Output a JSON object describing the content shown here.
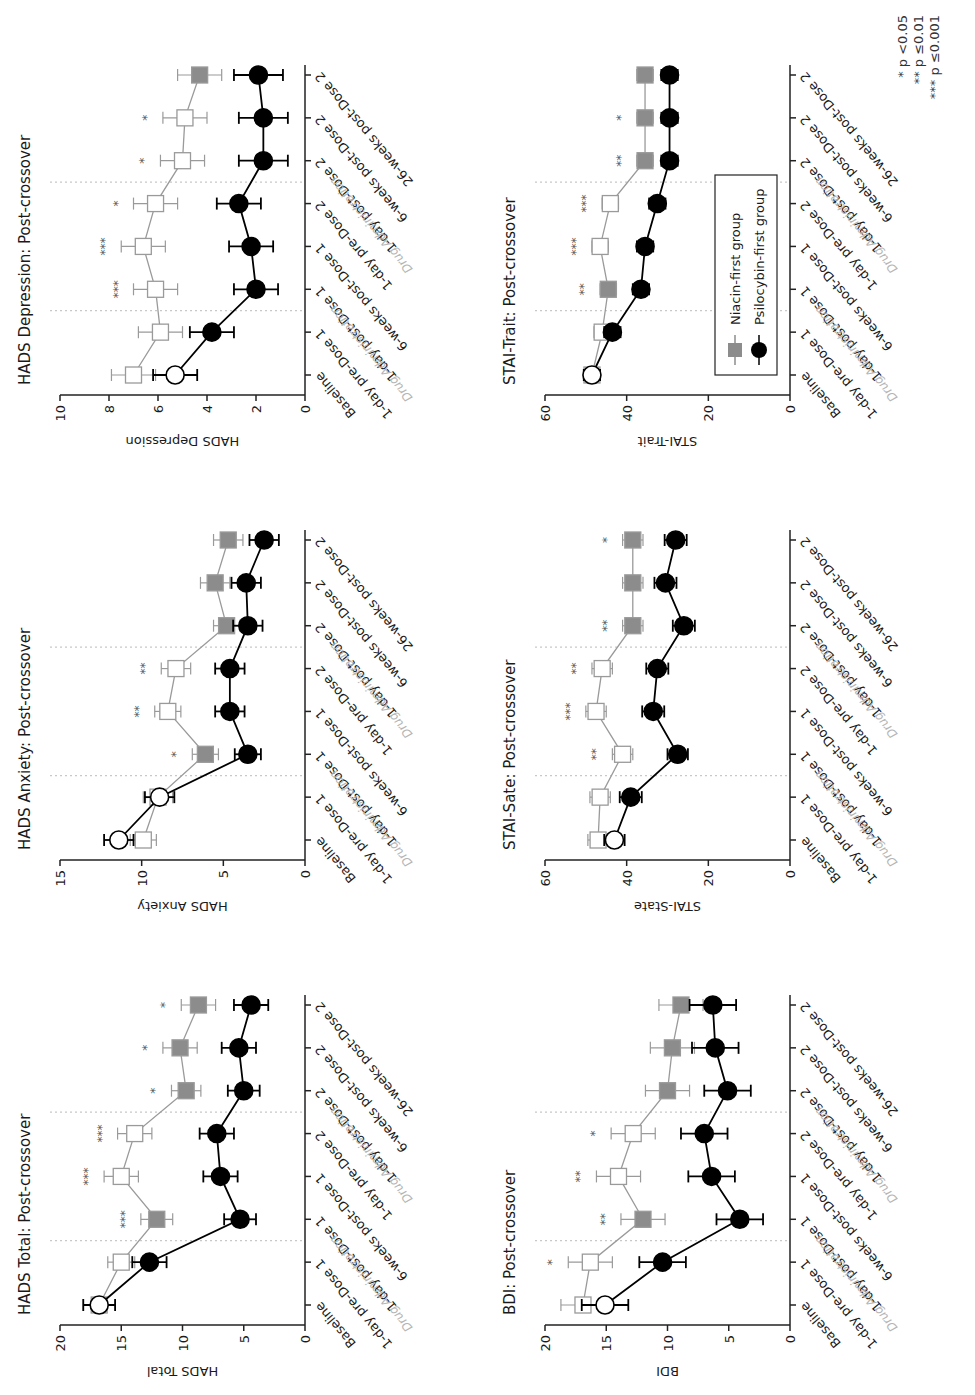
{
  "chart_data": [
    {
      "id": "hads_total",
      "type": "line",
      "title": "HADS Total: Post-crossover",
      "xlabel": "",
      "ylabel": "HADS Total",
      "ylim": [
        0,
        20
      ],
      "yticks": [
        0,
        5,
        10,
        15,
        20
      ],
      "categories": [
        "Baseline",
        "1-day pre-Dose 1",
        "1-day post-Dose 1",
        "6-weeks post-Dose 1",
        "1-day pre-Dose 2",
        "1-day post-Dose 2",
        "6-weeks post-Dose 2",
        "26-weeks post-Dose 2"
      ],
      "series": [
        {
          "name": "Niacin-first group",
          "values": [
            16.8,
            15.0,
            12.1,
            15.0,
            13.9,
            9.7,
            10.2,
            8.7
          ],
          "errors": [
            1.3,
            1.1,
            1.3,
            1.4,
            1.4,
            1.2,
            1.4,
            1.4
          ],
          "filled": [
            false,
            false,
            true,
            false,
            false,
            true,
            true,
            true
          ]
        },
        {
          "name": "Psilocybin-first group",
          "values": [
            16.8,
            12.7,
            5.3,
            6.9,
            7.2,
            5.0,
            5.4,
            4.4
          ],
          "errors": [
            1.3,
            1.4,
            1.3,
            1.4,
            1.4,
            1.3,
            1.4,
            1.4
          ],
          "filled": [
            false,
            true,
            true,
            true,
            true,
            true,
            true,
            true
          ]
        }
      ],
      "significance": [
        "",
        "",
        "***",
        "***",
        "***",
        "*",
        "*",
        "*"
      ]
    },
    {
      "id": "hads_anxiety",
      "type": "line",
      "title": "HADS Anxiety: Post-crossover",
      "xlabel": "",
      "ylabel": "HADS Anxiety",
      "ylim": [
        0,
        15
      ],
      "yticks": [
        0,
        5,
        10,
        15
      ],
      "categories": [
        "Baseline",
        "1-day pre-Dose 1",
        "1-day post-Dose 1",
        "6-weeks post-Dose 1",
        "1-day pre-Dose 2",
        "1-day post-Dose 2",
        "6-weeks post-Dose 2",
        "26-weeks post-Dose 2"
      ],
      "series": [
        {
          "name": "Niacin-first group",
          "values": [
            9.9,
            9.0,
            6.1,
            8.4,
            7.9,
            4.8,
            5.5,
            4.7
          ],
          "errors": [
            0.8,
            0.9,
            0.8,
            0.8,
            0.9,
            0.8,
            0.9,
            0.9
          ],
          "filled": [
            false,
            false,
            true,
            false,
            false,
            true,
            true,
            true
          ]
        },
        {
          "name": "Psilocybin-first group",
          "values": [
            11.4,
            8.9,
            3.5,
            4.6,
            4.6,
            3.5,
            3.6,
            2.5
          ],
          "errors": [
            0.9,
            0.9,
            0.8,
            0.9,
            0.9,
            0.9,
            0.9,
            0.9
          ],
          "filled": [
            false,
            false,
            true,
            true,
            true,
            true,
            true,
            true
          ]
        }
      ],
      "significance": [
        "",
        "",
        "*",
        "**",
        "**",
        "",
        "",
        ""
      ]
    },
    {
      "id": "hads_depression",
      "type": "line",
      "title": "HADS Depression: Post-crossover",
      "xlabel": "",
      "ylabel": "HADS Depression",
      "ylim": [
        0,
        10
      ],
      "yticks": [
        0,
        2,
        4,
        6,
        8,
        10
      ],
      "categories": [
        "Baseline",
        "1-day pre-Dose 1",
        "1-day post-Dose 1",
        "6-weeks post-Dose 1",
        "1-day pre-Dose 2",
        "1-day post-Dose 2",
        "6-weeks post-Dose 2",
        "26-weeks post-Dose 2"
      ],
      "series": [
        {
          "name": "Niacin-first group",
          "values": [
            7.0,
            5.9,
            6.1,
            6.6,
            6.1,
            5.0,
            4.9,
            4.3
          ],
          "errors": [
            0.9,
            0.9,
            0.9,
            0.9,
            0.9,
            0.9,
            0.9,
            0.9
          ],
          "filled": [
            false,
            false,
            false,
            false,
            false,
            false,
            false,
            true
          ]
        },
        {
          "name": "Psilocybin-first group",
          "values": [
            5.3,
            3.8,
            2.0,
            2.2,
            2.7,
            1.7,
            1.7,
            1.9
          ],
          "errors": [
            0.9,
            0.9,
            0.9,
            0.9,
            0.9,
            1.0,
            1.0,
            1.0
          ],
          "filled": [
            false,
            true,
            true,
            true,
            true,
            true,
            true,
            true
          ]
        }
      ],
      "significance": [
        "",
        "",
        "***",
        "***",
        "*",
        "*",
        "*",
        ""
      ]
    },
    {
      "id": "bdi",
      "type": "line",
      "title": "BDI: Post-crossover",
      "xlabel": "",
      "ylabel": "BDI",
      "ylim": [
        0,
        20
      ],
      "yticks": [
        0,
        5,
        10,
        15,
        20
      ],
      "categories": [
        "Baseline",
        "1-day pre-Dose 1",
        "1-day post-Dose 1",
        "6-weeks post-Dose 1",
        "1-day pre-Dose 2",
        "1-day post-Dose 2",
        "6-weeks post-Dose 2",
        "26-weeks post-Dose 2"
      ],
      "series": [
        {
          "name": "Niacin-first group",
          "values": [
            16.9,
            16.3,
            12.0,
            14.0,
            12.8,
            10.0,
            9.6,
            8.9
          ],
          "errors": [
            1.8,
            1.8,
            1.8,
            1.8,
            1.8,
            1.8,
            1.8,
            1.8
          ],
          "filled": [
            false,
            false,
            true,
            false,
            false,
            true,
            true,
            true
          ]
        },
        {
          "name": "Psilocybin-first group",
          "values": [
            15.1,
            10.4,
            4.1,
            6.4,
            7.0,
            5.1,
            6.1,
            6.3
          ],
          "errors": [
            1.9,
            1.9,
            1.9,
            1.9,
            1.9,
            1.9,
            1.9,
            1.9
          ],
          "filled": [
            false,
            true,
            true,
            true,
            true,
            true,
            true,
            true
          ]
        }
      ],
      "significance": [
        "",
        "*",
        "**",
        "**",
        "*",
        "",
        "",
        ""
      ]
    },
    {
      "id": "stai_state",
      "type": "line",
      "title": "STAI-Sate: Post-crossover",
      "xlabel": "",
      "ylabel": "STAI-State",
      "ylim": [
        0,
        60
      ],
      "yticks": [
        0,
        20,
        40,
        60
      ],
      "categories": [
        "Baseline",
        "1-day pre-Dose 1",
        "1-day post-Dose 1",
        "6-weeks post-Dose 1",
        "1-day pre-Dose 2",
        "1-day post-Dose 2",
        "6-weeks post-Dose 2",
        "26-weeks post-Dose 2"
      ],
      "series": [
        {
          "name": "Niacin-first group",
          "values": [
            47.0,
            46.5,
            41.0,
            47.5,
            46.0,
            38.5,
            38.5,
            38.5
          ],
          "errors": [
            2.5,
            2.5,
            2.5,
            2.5,
            2.5,
            2.5,
            2.5,
            2.5
          ],
          "filled": [
            false,
            false,
            false,
            false,
            false,
            true,
            true,
            true
          ]
        },
        {
          "name": "Psilocybin-first group",
          "values": [
            43.0,
            39.0,
            27.5,
            33.5,
            32.5,
            26.0,
            30.5,
            28.0
          ],
          "errors": [
            2.5,
            2.7,
            2.5,
            2.7,
            2.7,
            2.7,
            2.7,
            2.7
          ],
          "filled": [
            false,
            true,
            true,
            true,
            true,
            true,
            true,
            true
          ]
        }
      ],
      "significance": [
        "",
        "",
        "**",
        "***",
        "**",
        "**",
        "",
        "*"
      ]
    },
    {
      "id": "stai_trait",
      "type": "line",
      "title": "STAI-Trait: Post-crossover",
      "xlabel": "",
      "ylabel": "STAI-Trait",
      "ylim": [
        0,
        60
      ],
      "yticks": [
        0,
        20,
        40,
        60
      ],
      "categories": [
        "Baseline",
        "1-day pre-Dose 1",
        "1-day post-Dose 1",
        "6-weeks post-Dose 1",
        "1-day pre-Dose 2",
        "1-day post-Dose 2",
        "6-weeks post-Dose 2",
        "26-weeks post-Dose 2"
      ],
      "series": [
        {
          "name": "Niacin-first group",
          "values": [
            48.5,
            46.0,
            44.5,
            46.5,
            44.0,
            35.5,
            35.5,
            35.5
          ],
          "errors": [
            2.0,
            2.0,
            2.0,
            2.0,
            2.0,
            2.0,
            2.0,
            2.0
          ],
          "filled": [
            false,
            false,
            true,
            false,
            false,
            true,
            true,
            true
          ]
        },
        {
          "name": "Psilocybin-first group",
          "values": [
            48.5,
            43.5,
            36.5,
            35.5,
            32.5,
            29.5,
            29.5,
            29.5
          ],
          "errors": [
            2.0,
            2.0,
            2.0,
            2.0,
            2.0,
            2.0,
            2.0,
            2.0
          ],
          "filled": [
            false,
            true,
            true,
            true,
            true,
            true,
            true,
            true
          ]
        }
      ],
      "significance": [
        "",
        "",
        "**",
        "***",
        "***",
        "**",
        "*",
        ""
      ]
    }
  ],
  "annotations": {
    "drug_administration": "Drug Administration",
    "drug_administration_after_index": [
      1,
      4
    ]
  },
  "legend": {
    "items": [
      {
        "label": "Niacin-first group",
        "marker": "square",
        "color": "#8c8c8c"
      },
      {
        "label": "Psilocybin-first group",
        "marker": "circle",
        "color": "#000000"
      }
    ],
    "location": "inside STAI-Trait panel, lower area"
  },
  "significance_key": [
    "* p <0.05",
    "** p ≤0.01",
    "*** p ≤0.001"
  ],
  "colors": {
    "niacin_line": "#9a9a9a",
    "niacin_fill": "#8c8c8c",
    "psilocybin": "#000000",
    "open_marker_fill": "#ffffff",
    "dotted_divider": "#c8c8c8",
    "drug_label": "#b5b5b5"
  }
}
